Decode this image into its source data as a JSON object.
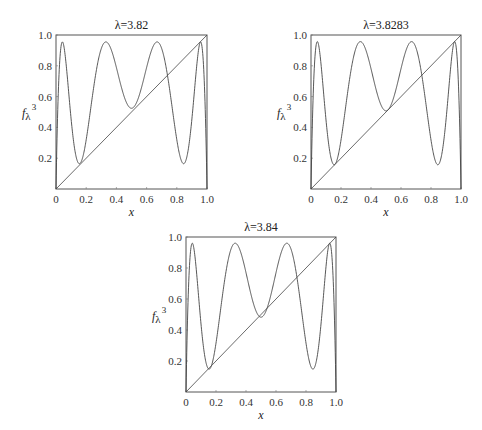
{
  "chart_data": [
    {
      "type": "line",
      "title": "λ=3.82",
      "lambda": 3.82,
      "function": "f_λ^3(x), f_λ(x) = λx(1−x)",
      "xlabel": "x",
      "ylabel": "fλ",
      "ylabel_sup": "3",
      "xlim": [
        0,
        1
      ],
      "ylim": [
        0,
        1
      ],
      "xticks": [
        "0",
        "0.2",
        "0.4",
        "0.6",
        "0.8",
        "1.0"
      ],
      "yticks": [
        "0.2",
        "0.4",
        "0.6",
        "0.8",
        "1.0"
      ],
      "series": [
        {
          "name": "f_λ^3(x)",
          "x": [
            0,
            0.05,
            0.15,
            0.32,
            0.5,
            0.66,
            0.84,
            0.95,
            1.0
          ],
          "y": [
            0,
            0.955,
            0.18,
            0.955,
            0.56,
            0.955,
            0.18,
            0.955,
            0
          ]
        },
        {
          "name": "y=x",
          "x": [
            0,
            1
          ],
          "y": [
            0,
            1
          ]
        }
      ],
      "grid": false
    },
    {
      "type": "line",
      "title": "λ=3.8283",
      "lambda": 3.8283,
      "function": "f_λ^3(x), f_λ(x) = λx(1−x)",
      "xlabel": "x",
      "ylabel": "fλ",
      "ylabel_sup": "3",
      "xlim": [
        0,
        1
      ],
      "ylim": [
        0,
        1
      ],
      "xticks": [
        "0",
        "0.2",
        "0.4",
        "0.6",
        "0.8",
        "1.0"
      ],
      "yticks": [
        "0.2",
        "0.4",
        "0.6",
        "0.8",
        "1.0"
      ],
      "series": [
        {
          "name": "f_λ^3(x)",
          "x": [
            0,
            0.05,
            0.16,
            0.32,
            0.5,
            0.66,
            0.84,
            0.95,
            1.0
          ],
          "y": [
            0,
            0.957,
            0.16,
            0.957,
            0.51,
            0.957,
            0.16,
            0.957,
            0
          ]
        },
        {
          "name": "y=x",
          "x": [
            0,
            1
          ],
          "y": [
            0,
            1
          ]
        }
      ],
      "grid": false
    },
    {
      "type": "line",
      "title": "λ=3.84",
      "lambda": 3.84,
      "function": "f_λ^3(x), f_λ(x) = λx(1−x)",
      "xlabel": "x",
      "ylabel": "fλ",
      "ylabel_sup": "3",
      "xlim": [
        0,
        1
      ],
      "ylim": [
        0,
        1
      ],
      "xticks": [
        "0",
        "0.2",
        "0.4",
        "0.6",
        "0.8",
        "1.0"
      ],
      "yticks": [
        "0.2",
        "0.4",
        "0.6",
        "0.8",
        "1.0"
      ],
      "series": [
        {
          "name": "f_λ^3(x)",
          "x": [
            0,
            0.05,
            0.16,
            0.32,
            0.5,
            0.66,
            0.84,
            0.95,
            1.0
          ],
          "y": [
            0,
            0.96,
            0.15,
            0.96,
            0.48,
            0.96,
            0.15,
            0.96,
            0
          ]
        },
        {
          "name": "y=x",
          "x": [
            0,
            1
          ],
          "y": [
            0,
            1
          ]
        }
      ],
      "grid": false
    }
  ]
}
